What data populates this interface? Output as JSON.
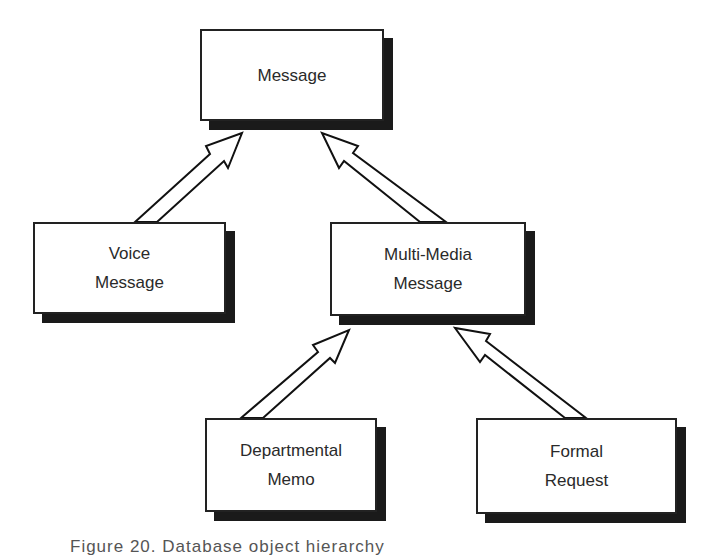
{
  "diagram": {
    "type": "class-hierarchy",
    "nodes": [
      {
        "id": "message",
        "lines": [
          "Message"
        ]
      },
      {
        "id": "voice_message",
        "lines": [
          "Voice",
          "Message"
        ]
      },
      {
        "id": "multimedia_message",
        "lines": [
          "Multi-Media",
          "Message"
        ]
      },
      {
        "id": "departmental_memo",
        "lines": [
          "Departmental",
          "Memo"
        ]
      },
      {
        "id": "formal_request",
        "lines": [
          "Formal",
          "Request"
        ]
      }
    ],
    "edges": [
      {
        "from": "voice_message",
        "to": "message",
        "type": "inheritance-arrow"
      },
      {
        "from": "multimedia_message",
        "to": "message",
        "type": "inheritance-arrow"
      },
      {
        "from": "departmental_memo",
        "to": "multimedia_message",
        "type": "inheritance-arrow"
      },
      {
        "from": "formal_request",
        "to": "multimedia_message",
        "type": "inheritance-arrow"
      }
    ],
    "caption": "Figure 20. Database object hierarchy"
  }
}
